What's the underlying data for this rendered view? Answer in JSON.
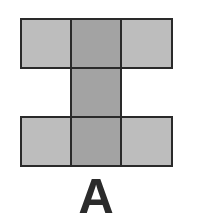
{
  "figure": {
    "label": "A",
    "colors": {
      "light": "#bdbdbd",
      "dark": "#a3a3a3",
      "border": "#2a2a2a"
    },
    "cells": [
      {
        "row": 0,
        "col": 0,
        "shade": "light"
      },
      {
        "row": 0,
        "col": 1,
        "shade": "dark"
      },
      {
        "row": 0,
        "col": 2,
        "shade": "light"
      },
      {
        "row": 1,
        "col": 1,
        "shade": "dark"
      },
      {
        "row": 2,
        "col": 0,
        "shade": "light"
      },
      {
        "row": 2,
        "col": 1,
        "shade": "dark"
      },
      {
        "row": 2,
        "col": 2,
        "shade": "light"
      }
    ]
  }
}
